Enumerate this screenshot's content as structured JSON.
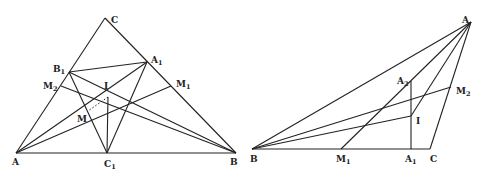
{
  "figures": [
    {
      "name": "left-triangle",
      "points": {
        "A": {
          "x": 16,
          "y": 153,
          "label": "A",
          "sub": "",
          "lx": 12,
          "ly": 165
        },
        "B": {
          "x": 236,
          "y": 153,
          "label": "B",
          "sub": "",
          "lx": 230,
          "ly": 165
        },
        "C": {
          "x": 105,
          "y": 18,
          "label": "C",
          "sub": "",
          "lx": 111,
          "ly": 23
        },
        "C1": {
          "x": 107,
          "y": 153,
          "label": "C",
          "sub": "1",
          "lx": 104,
          "ly": 167
        },
        "B1": {
          "x": 69,
          "y": 72,
          "label": "B",
          "sub": "1",
          "lx": 53,
          "ly": 72
        },
        "A1": {
          "x": 147,
          "y": 62,
          "label": "A",
          "sub": "1",
          "lx": 151,
          "ly": 63
        },
        "M2": {
          "x": 61,
          "y": 86,
          "label": "M",
          "sub": "2",
          "lx": 43,
          "ly": 89
        },
        "M1": {
          "x": 171,
          "y": 86,
          "label": "M",
          "sub": "1",
          "lx": 176,
          "ly": 87
        },
        "I": {
          "x": 108,
          "y": 97,
          "label": "I",
          "sub": "",
          "lx": 104,
          "ly": 89
        },
        "M": {
          "x": 88,
          "y": 111,
          "label": "M",
          "sub": "",
          "lx": 77,
          "ly": 122
        }
      },
      "segments": [
        [
          "A",
          "B"
        ],
        [
          "B",
          "C"
        ],
        [
          "C",
          "A"
        ],
        [
          "B1",
          "A1"
        ],
        [
          "B1",
          "C1"
        ],
        [
          "A1",
          "C1"
        ],
        [
          "A",
          "A1"
        ],
        [
          "A",
          "M1"
        ],
        [
          "B",
          "B1"
        ],
        [
          "B",
          "M2"
        ],
        [
          "I",
          "C1"
        ]
      ],
      "dashed": [
        [
          "I",
          "M"
        ]
      ]
    },
    {
      "name": "right-triangle",
      "points": {
        "A": {
          "x": 471,
          "y": 22,
          "label": "A",
          "sub": "",
          "lx": 462,
          "ly": 23
        },
        "B": {
          "x": 252,
          "y": 149,
          "label": "B",
          "sub": "",
          "lx": 250,
          "ly": 162
        },
        "C": {
          "x": 430,
          "y": 149,
          "label": "C",
          "sub": "",
          "lx": 430,
          "ly": 162
        },
        "A1": {
          "x": 411,
          "y": 149,
          "label": "A",
          "sub": "1",
          "lx": 405,
          "ly": 162
        },
        "A2": {
          "x": 411,
          "y": 81,
          "label": "A",
          "sub": "2",
          "lx": 397,
          "ly": 84
        },
        "I": {
          "x": 411,
          "y": 116,
          "label": "I",
          "sub": "",
          "lx": 416,
          "ly": 124
        },
        "M2": {
          "x": 451,
          "y": 87,
          "label": "M",
          "sub": "2",
          "lx": 456,
          "ly": 94
        },
        "M1": {
          "x": 341,
          "y": 149,
          "label": "M",
          "sub": "1",
          "lx": 336,
          "ly": 162
        }
      },
      "segments": [
        [
          "A",
          "B"
        ],
        [
          "B",
          "C"
        ],
        [
          "C",
          "A"
        ],
        [
          "A",
          "M1"
        ],
        [
          "A",
          "I"
        ],
        [
          "B",
          "M2"
        ],
        [
          "B",
          "I"
        ],
        [
          "A2",
          "A1"
        ]
      ],
      "dashed": []
    }
  ]
}
